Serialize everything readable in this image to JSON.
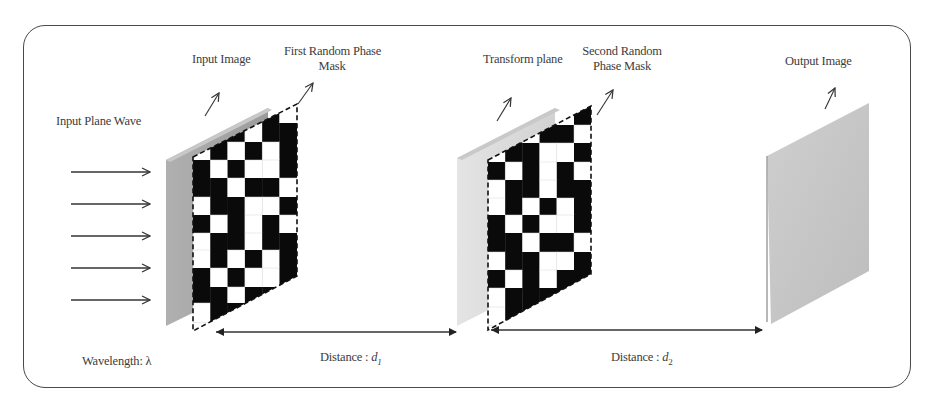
{
  "diagram": {
    "labels": {
      "input_plane_wave": "Input Plane Wave",
      "input_image": "Input Image",
      "first_mask_line1": "First Random Phase",
      "first_mask_line2": "Mask",
      "transform_plane": "Transform plane",
      "second_mask_line1": "Second Random",
      "second_mask_line2": "Phase Mask",
      "output_image": "Output Image",
      "wavelength_prefix": "Wavelength: ",
      "wavelength_symbol": "λ",
      "distance1_prefix": "Distance : ",
      "distance1_symbol": "d",
      "distance1_sub": "1",
      "distance2_prefix": "Distance : ",
      "distance2_symbol": "d",
      "distance2_sub": "2"
    },
    "input_wave_arrows": 5,
    "colors": {
      "frame": "#4a4a4a",
      "input_plane": "#a8a8a8",
      "transform_plane": "#dcdcdc",
      "output_plane": "#c4c4c4",
      "mask_black": "#0a0a0a",
      "mask_white": "#ffffff",
      "arrow": "#333333"
    },
    "masks": [
      {
        "name": "first-random-phase-mask",
        "x0": 193,
        "col_w": 17.3,
        "cols": 6,
        "row_tops": [
          103,
          123,
          142,
          160,
          178,
          197,
          215,
          233,
          250,
          268,
          287,
          303,
          322
        ],
        "grid": [
          "BBBBBW",
          "BBBWBB",
          "WBWBWB",
          "BWBWWB",
          "BBWBBW",
          "WBBWWB",
          "BWBWBW",
          "WBBWBB",
          "WBWBWB",
          "BWBWWB",
          "BBWBBB",
          "WBBBBB"
        ],
        "poly": {
          "tl": [
            193,
            157
          ],
          "tr": [
            297,
            104
          ],
          "br": [
            297,
            276
          ],
          "bl": [
            193,
            331
          ]
        }
      },
      {
        "name": "second-random-phase-mask",
        "x0": 488,
        "col_w": 17.2,
        "cols": 6,
        "row_tops": [
          107,
          125,
          143,
          162,
          180,
          198,
          215,
          233,
          252,
          270,
          288,
          307,
          325
        ],
        "grid": [
          "BBBBWB",
          "BBWBBW",
          "WBBWWB",
          "BWBWBW",
          "WBBWBB",
          "WBWBWB",
          "BWBWWB",
          "BBWBBW",
          "WBBWWB",
          "BWBWBB",
          "WBBBBB",
          "WBBBBB"
        ],
        "poly": {
          "tl": [
            488,
            160
          ],
          "tr": [
            591,
            106
          ],
          "br": [
            591,
            274
          ],
          "bl": [
            488,
            330
          ]
        }
      }
    ]
  }
}
